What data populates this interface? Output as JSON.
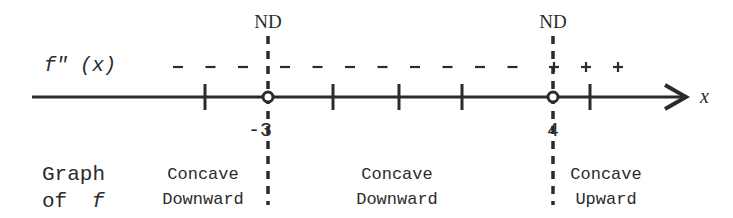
{
  "diagram": {
    "axis": {
      "variable_label": "x",
      "function_label": "f\" (x)",
      "critical_points": [
        {
          "value": "-3",
          "label": "-3",
          "annotation": "ND",
          "marker": "open-circle"
        },
        {
          "value": "4",
          "label": "4",
          "annotation": "ND",
          "marker": "open-circle"
        }
      ],
      "tick_count_between": {
        "left_of_first": 1,
        "between": 3,
        "right_of_second": 1
      }
    },
    "sign_row": {
      "intervals": [
        {
          "interval": "x < -3",
          "sign": "-",
          "symbol_count": 3
        },
        {
          "interval": "-3 < x < 4",
          "sign": "-",
          "symbol_count": 8
        },
        {
          "interval": "x > 4",
          "sign": "+",
          "symbol_count": 3
        }
      ]
    },
    "concavity_row": {
      "row_label_line1": "Graph",
      "row_label_line2_prefix": "of",
      "row_label_line2_var": "f",
      "intervals": [
        {
          "line1": "Concave",
          "line2": "Downward"
        },
        {
          "line1": "Concave",
          "line2": "Downward"
        },
        {
          "line1": "Concave",
          "line2": "Upward"
        }
      ]
    },
    "colors": {
      "ink": "#2b2b2b",
      "background": "#ffffff"
    }
  }
}
